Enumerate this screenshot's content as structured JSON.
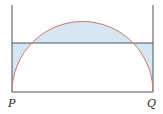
{
  "diagram": {
    "labels": {
      "left_point": "P",
      "right_point": "Q"
    },
    "colors": {
      "arc": "#c97a6a",
      "lines": "#4a5560",
      "shading": "#d6e7f3"
    }
  }
}
